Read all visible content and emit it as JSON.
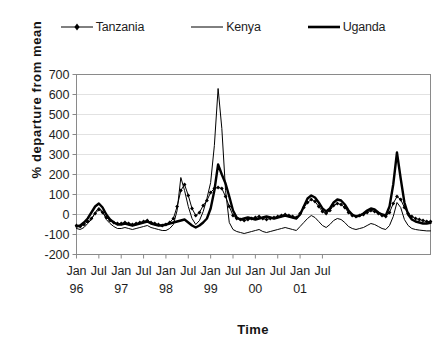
{
  "legend": {
    "entries": [
      {
        "label": "Tanzania",
        "style": "thin-with-markers",
        "color": "#000000"
      },
      {
        "label": "Kenya",
        "style": "thin",
        "color": "#000000"
      },
      {
        "label": "Uganda",
        "style": "thick",
        "color": "#000000"
      }
    ]
  },
  "axes": {
    "ylabel": "% departure from mean",
    "xlabel": "Time"
  },
  "chart_data": {
    "type": "line",
    "title": "",
    "xlabel": "Time",
    "ylabel": "% departure from mean",
    "ylim": [
      -200,
      700
    ],
    "yticks": [
      -200,
      -100,
      0,
      100,
      200,
      300,
      400,
      500,
      600,
      700
    ],
    "ytick_labels": [
      "-200",
      "-100",
      "0",
      "100",
      "200",
      "300",
      "400",
      "500",
      "600",
      "700"
    ],
    "grid": true,
    "grid_axis": "y",
    "legend_position": "top-center",
    "x_axis_type": "monthly-time",
    "x_start": "Jan 96",
    "x_end": "Dec 01",
    "xticks": [
      {
        "month": "Jan",
        "year": "96"
      },
      {
        "month": "Jul",
        "year": ""
      },
      {
        "month": "Jan",
        "year": "97"
      },
      {
        "month": "Jul",
        "year": ""
      },
      {
        "month": "Jan",
        "year": "98"
      },
      {
        "month": "Jul",
        "year": ""
      },
      {
        "month": "Jan",
        "year": "99"
      },
      {
        "month": "Jul",
        "year": ""
      },
      {
        "month": "Jan",
        "year": "00"
      },
      {
        "month": "Jul",
        "year": ""
      },
      {
        "month": "Jan",
        "year": "01"
      },
      {
        "month": "Jul",
        "year": ""
      }
    ],
    "series": [
      {
        "name": "Tanzania",
        "style": "thin-with-markers",
        "values": [
          -55,
          -60,
          -50,
          -35,
          -20,
          5,
          25,
          10,
          -15,
          -30,
          -40,
          -45,
          -45,
          -40,
          -45,
          -50,
          -45,
          -40,
          -35,
          -30,
          -40,
          -45,
          -50,
          -55,
          -50,
          -40,
          -20,
          40,
          120,
          150,
          95,
          30,
          -5,
          10,
          45,
          70,
          110,
          130,
          135,
          130,
          90,
          40,
          -5,
          -20,
          -25,
          -30,
          -25,
          -20,
          -15,
          -10,
          -20,
          -25,
          -20,
          -15,
          -10,
          -5,
          0,
          -5,
          -10,
          -15,
          5,
          35,
          60,
          75,
          65,
          40,
          15,
          5,
          20,
          45,
          55,
          50,
          35,
          10,
          -5,
          -10,
          -5,
          0,
          10,
          20,
          15,
          5,
          -5,
          -10,
          10,
          55,
          90,
          75,
          35,
          5,
          -10,
          -20,
          -25,
          -30,
          -35,
          -35
        ]
      },
      {
        "name": "Kenya",
        "style": "thin",
        "values": [
          -70,
          -75,
          -65,
          -45,
          -25,
          10,
          35,
          15,
          -25,
          -45,
          -60,
          -70,
          -70,
          -65,
          -70,
          -75,
          -70,
          -65,
          -60,
          -55,
          -65,
          -70,
          -75,
          -80,
          -80,
          -70,
          -50,
          20,
          185,
          120,
          40,
          -20,
          -50,
          -30,
          15,
          80,
          160,
          345,
          630,
          430,
          120,
          -40,
          -75,
          -85,
          -90,
          -95,
          -90,
          -85,
          -80,
          -75,
          -85,
          -90,
          -85,
          -80,
          -75,
          -70,
          -65,
          -70,
          -75,
          -80,
          -60,
          -40,
          -20,
          -5,
          -15,
          -35,
          -55,
          -65,
          -50,
          -30,
          -20,
          -25,
          -40,
          -60,
          -70,
          -75,
          -70,
          -65,
          -55,
          -45,
          -50,
          -60,
          -70,
          -75,
          -55,
          -10,
          60,
          35,
          -25,
          -55,
          -70,
          -75,
          -78,
          -80,
          -82,
          -82
        ]
      },
      {
        "name": "Uganda",
        "style": "thick",
        "values": [
          -60,
          -55,
          -40,
          -20,
          10,
          40,
          55,
          35,
          0,
          -25,
          -40,
          -50,
          -50,
          -45,
          -50,
          -55,
          -50,
          -45,
          -40,
          -35,
          -45,
          -50,
          -55,
          -55,
          -50,
          -45,
          -40,
          -35,
          -30,
          -25,
          -40,
          -55,
          -65,
          -55,
          -40,
          -20,
          30,
          120,
          250,
          200,
          155,
          90,
          20,
          -15,
          -25,
          -20,
          -15,
          -20,
          -25,
          -20,
          -15,
          -10,
          -15,
          -20,
          -15,
          -10,
          -5,
          -10,
          -15,
          -20,
          0,
          40,
          80,
          95,
          85,
          60,
          30,
          15,
          30,
          60,
          75,
          70,
          50,
          20,
          0,
          -10,
          -5,
          5,
          20,
          30,
          25,
          10,
          0,
          -5,
          40,
          150,
          310,
          180,
          60,
          0,
          -25,
          -35,
          -40,
          -45,
          -45,
          -42
        ]
      }
    ],
    "notable_points": [
      {
        "series": "Kenya",
        "label": "Jan 98 peak",
        "value": 630
      },
      {
        "series": "Uganda",
        "label": "Jan 98 peak",
        "value": 250
      },
      {
        "series": "Uganda",
        "label": "Jan 01 peak",
        "value": 310
      },
      {
        "series": "Tanzania",
        "label": "Jan 98 peak",
        "value": 135
      }
    ]
  }
}
